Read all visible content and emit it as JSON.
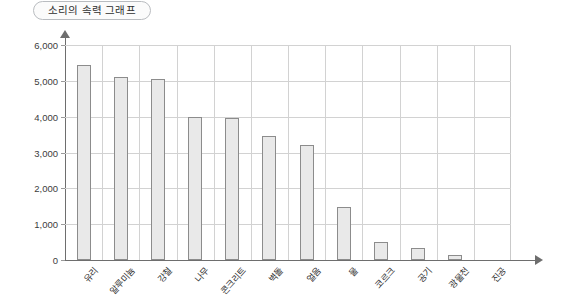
{
  "title": "소리의 속력 그래프",
  "chart_data": {
    "type": "bar",
    "title": "소리의 속력 그래프",
    "xlabel": "",
    "ylabel": "",
    "ylim": [
      0,
      6000
    ],
    "ytick_labels": [
      "6,000",
      "5,000",
      "4,000",
      "3,000",
      "2,000",
      "1,000",
      "0"
    ],
    "yticks": [
      6000,
      5000,
      4000,
      3000,
      2000,
      1000,
      0
    ],
    "grid": true,
    "legend": "none",
    "categories": [
      "유리",
      "알루미늄",
      "강철",
      "나무",
      "콘크리트",
      "벽돌",
      "얼음",
      "물",
      "코르크",
      "공기",
      "광물천",
      "진공"
    ],
    "values": [
      5450,
      5100,
      5050,
      4000,
      3950,
      3450,
      3200,
      1480,
      500,
      340,
      150,
      0
    ]
  }
}
